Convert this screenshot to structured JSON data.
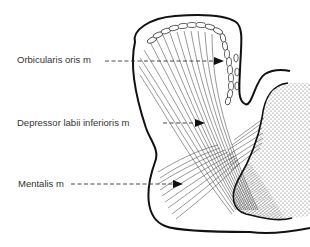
{
  "diagram": {
    "type": "anatomical cross-section",
    "labels": [
      {
        "id": "orbicularis",
        "text": "Orbicularis oris m",
        "x": 17,
        "y": 55,
        "arrow_from": [
          105,
          61
        ],
        "arrow_to": [
          222,
          61
        ]
      },
      {
        "id": "depressor",
        "text": "Depressor labii inferioris m",
        "x": 17,
        "y": 118,
        "arrow_from": [
          163,
          123
        ],
        "arrow_to": [
          203,
          123
        ]
      },
      {
        "id": "mentalis",
        "text": "Mentalis m",
        "x": 18,
        "y": 179,
        "arrow_from": [
          71,
          184
        ],
        "arrow_to": [
          181,
          184
        ]
      }
    ],
    "colors": {
      "outline": "#111111",
      "fibers": "#444444",
      "dashed_leader": "#333333",
      "text": "#333333",
      "background": "#ffffff"
    }
  }
}
